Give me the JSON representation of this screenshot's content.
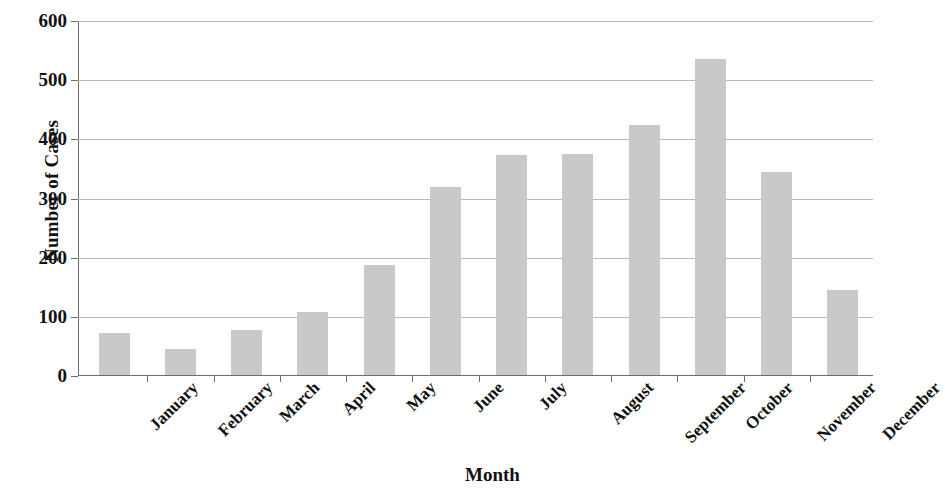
{
  "chart_data": {
    "type": "bar",
    "title": "",
    "xlabel": "Month",
    "ylabel": "Number of Cases",
    "categories": [
      "January",
      "February",
      "March",
      "April",
      "May",
      "June",
      "July",
      "August",
      "September",
      "October",
      "November",
      "December"
    ],
    "values": [
      72,
      45,
      78,
      108,
      187,
      320,
      373,
      376,
      425,
      535,
      344,
      145
    ],
    "ylim": [
      0,
      600
    ],
    "ytick_labels": [
      "0",
      "100",
      "200",
      "300",
      "400",
      "500",
      "600"
    ],
    "ytick_values": [
      0,
      100,
      200,
      300,
      400,
      500,
      600
    ],
    "grid": true,
    "legend": "none",
    "bar_color": "#c9c9c9",
    "axis_color": "#6d6d6d",
    "gridline_color": "#b9b9b9",
    "text_color": "#111111"
  }
}
